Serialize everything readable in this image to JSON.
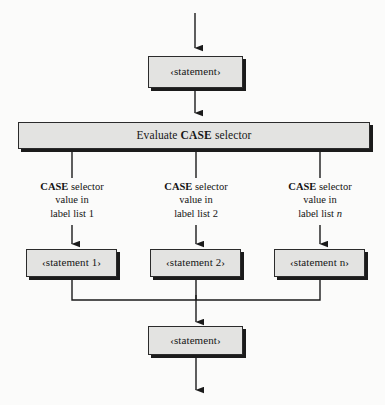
{
  "figure": {
    "type": "flowchart",
    "background_color": "#fbfbfa",
    "node_fill_color": "#e3e3e1",
    "node_border_color": "#2b2b2b",
    "node_shadow_color": "#1b1b1b",
    "line_color": "#1b1b1b"
  },
  "nodes": {
    "entry_statement": {
      "text": "‹statement›",
      "shape": "rectangle"
    },
    "case_selector": {
      "prefix": "Evaluate ",
      "keyword": "CASE",
      "suffix": " selector",
      "shape": "rectangle"
    },
    "branch_statement_1": {
      "text": "‹statement 1›",
      "shape": "rectangle"
    },
    "branch_statement_2": {
      "text": "‹statement 2›",
      "shape": "rectangle"
    },
    "branch_statement_n": {
      "text": "‹statement n›",
      "shape": "rectangle"
    },
    "exit_statement": {
      "text": "‹statement›",
      "shape": "rectangle"
    }
  },
  "branch_labels": [
    {
      "keyword": "CASE",
      "line1_rest": " selector",
      "line2": "value in",
      "line3_prefix": "label list ",
      "line3_index": "1",
      "line3_index_italic": false
    },
    {
      "keyword": "CASE",
      "line1_rest": " selector",
      "line2": "value in",
      "line3_prefix": "label list ",
      "line3_index": "2",
      "line3_index_italic": false
    },
    {
      "keyword": "CASE",
      "line1_rest": " selector",
      "line2": "value in",
      "line3_prefix": "label list ",
      "line3_index": "n",
      "line3_index_italic": true
    }
  ],
  "connectors": [
    {
      "name": "entry-arrow",
      "from": "top-edge",
      "to": "entry_statement",
      "arrowhead": true
    },
    {
      "name": "entry-to-case-arrow",
      "from": "entry_statement",
      "to": "case_selector",
      "arrowhead": true
    },
    {
      "name": "case-to-branch-1",
      "from": "case_selector",
      "to": "branch_statement_1",
      "arrowhead": true
    },
    {
      "name": "case-to-branch-2",
      "from": "case_selector",
      "to": "branch_statement_2",
      "arrowhead": true
    },
    {
      "name": "case-to-branch-n",
      "from": "case_selector",
      "to": "branch_statement_n",
      "arrowhead": true
    },
    {
      "name": "merge-junction",
      "from": "branch statements",
      "to": "exit_statement",
      "arrowhead": true
    },
    {
      "name": "exit-arrow",
      "from": "exit_statement",
      "to": "bottom-edge",
      "arrowhead": true
    }
  ]
}
